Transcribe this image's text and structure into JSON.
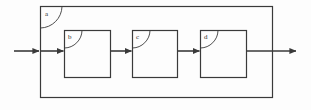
{
  "diagram": {
    "type": "block-diagram",
    "title": "",
    "background_color": "#fdfdfd",
    "line_color": "#3a3a3a",
    "label_color": "#2b2b2b",
    "outer_block": {
      "label": "a",
      "x": 40,
      "y": 6,
      "width": 232,
      "height": 91,
      "fill": "none",
      "leader_arc": true
    },
    "inner_blocks": [
      {
        "label": "b",
        "x": 64,
        "y": 30,
        "width": 46,
        "height": 47,
        "fill": "none",
        "leader_arc": true
      },
      {
        "label": "c",
        "x": 132,
        "y": 30,
        "width": 45,
        "height": 47,
        "fill": "none",
        "leader_arc": true
      },
      {
        "label": "d",
        "x": 200,
        "y": 30,
        "width": 46,
        "height": 47,
        "fill": "none",
        "leader_arc": true
      }
    ],
    "connectors": [
      {
        "name": "input-arrow-external",
        "x1": 14,
        "y1": 51,
        "x2": 40,
        "y2": 51,
        "arrowhead": "end"
      },
      {
        "name": "input-arrow-to-b",
        "x1": 40,
        "y1": 51,
        "x2": 64,
        "y2": 51,
        "arrowhead": "end"
      },
      {
        "name": "arrow-b-to-c",
        "x1": 110,
        "y1": 51,
        "x2": 132,
        "y2": 51,
        "arrowhead": "end"
      },
      {
        "name": "arrow-c-to-d",
        "x1": 177,
        "y1": 51,
        "x2": 200,
        "y2": 51,
        "arrowhead": "end"
      },
      {
        "name": "output-arrow",
        "x1": 246,
        "y1": 51,
        "x2": 297,
        "y2": 51,
        "arrowhead": "end"
      }
    ]
  }
}
